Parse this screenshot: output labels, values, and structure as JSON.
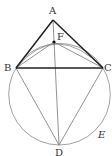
{
  "diagram": {
    "points": {
      "A": {
        "label": "A",
        "x": 53,
        "y": 20
      },
      "B": {
        "label": "B",
        "x": 16,
        "y": 68
      },
      "C": {
        "label": "C",
        "x": 103,
        "y": 68
      },
      "D": {
        "label": "D",
        "x": 59,
        "y": 145
      },
      "F": {
        "label": "F",
        "x": 54,
        "y": 42
      }
    },
    "circle_label": "E",
    "circle": {
      "cx": 59.5,
      "cy": 94.2,
      "r": 50.8
    },
    "colors": {
      "thick_line": "#222222",
      "thin_line": "#777777"
    }
  }
}
